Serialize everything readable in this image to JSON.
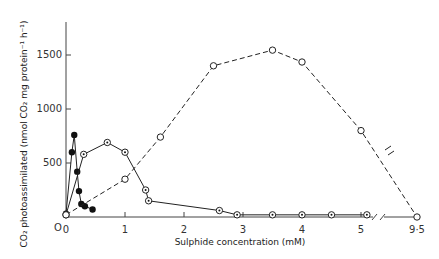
{
  "chart_data": {
    "type": "line",
    "title": "",
    "xlabel": "Sulphide concentration (mM)",
    "ylabel": "CO2 photoassimilated (nmol CO2 mg protein-1 h-1)",
    "xlim": [
      0,
      9.5
    ],
    "ylim": [
      0,
      1800
    ],
    "x_ticks": [
      "0",
      "1",
      "2",
      "3",
      "4",
      "5",
      "9·5"
    ],
    "y_ticks": [
      "0",
      "500",
      "1000",
      "1500"
    ],
    "axis_break": "between 5 and 9.5 on x-axis",
    "grid": false,
    "legend": null,
    "series": [
      {
        "name": "closed circles (solid line)",
        "marker": "filled-circle",
        "line": "solid",
        "x": [
          0,
          0.1,
          0.14,
          0.19,
          0.22,
          0.26,
          0.32,
          0.45
        ],
        "y": [
          30,
          600,
          760,
          420,
          240,
          120,
          100,
          70
        ]
      },
      {
        "name": "dotted circles (solid line)",
        "marker": "dotted-circle",
        "line": "solid",
        "x": [
          0,
          0.3,
          0.7,
          1.0,
          1.35,
          1.4,
          2.6,
          2.9,
          3.5,
          4.0,
          4.5,
          5.1
        ],
        "y": [
          20,
          580,
          690,
          600,
          250,
          150,
          60,
          20,
          20,
          20,
          20,
          20
        ]
      },
      {
        "name": "open circles (dashed line)",
        "marker": "open-circle",
        "line": "dashed",
        "x": [
          0,
          1.0,
          1.6,
          2.5,
          3.5,
          4.0,
          5.0,
          9.5
        ],
        "y": [
          20,
          350,
          740,
          1400,
          1545,
          1435,
          800,
          0
        ]
      }
    ]
  },
  "labels": {
    "xlabel": "Sulphide concentration (mM)",
    "ylabel": "CO₂ photoassimilated (nmol CO₂ mg protein⁻¹ h⁻¹)",
    "origin": "O"
  }
}
